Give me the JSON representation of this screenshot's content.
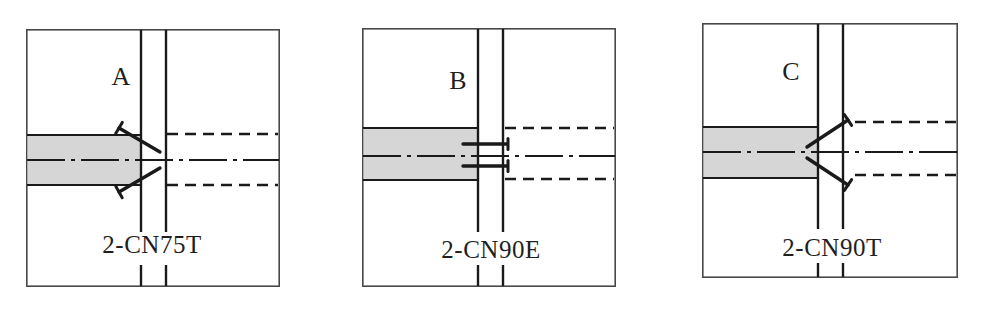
{
  "figure": {
    "panels": [
      {
        "label": "A",
        "caption": "2-CN75T"
      },
      {
        "label": "B",
        "caption": "2-CN90E"
      },
      {
        "label": "C",
        "caption": "2-CN90T"
      }
    ]
  },
  "colors": {
    "bg": "#ffffff",
    "line": "#1a1a1a",
    "border": "#484848",
    "member_fill": "#d6d6d6",
    "text": "#1f1f1f"
  }
}
